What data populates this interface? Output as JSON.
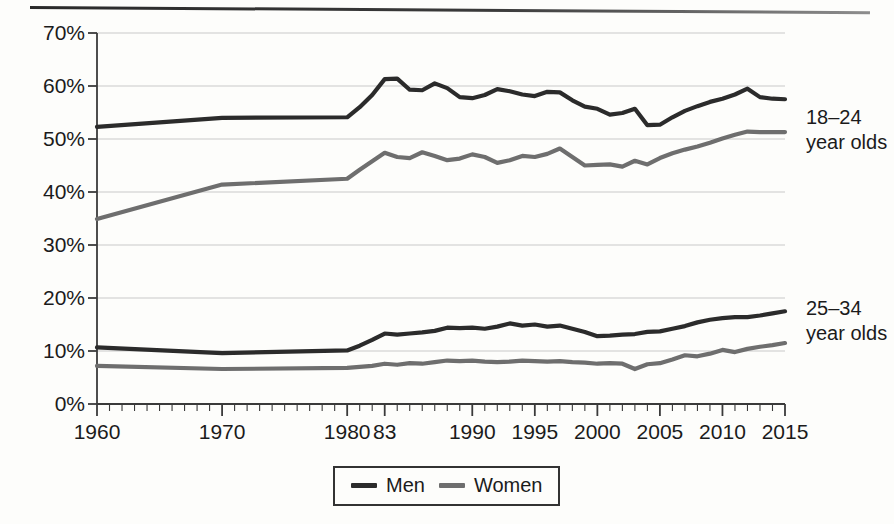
{
  "chart_data": {
    "type": "line",
    "title": "",
    "xlabel": "",
    "ylabel": "",
    "ylim": [
      0,
      70
    ],
    "xlim": [
      1960,
      2015
    ],
    "grid": true,
    "y_ticks": [
      "0%",
      "10%",
      "20%",
      "30%",
      "40%",
      "50%",
      "60%",
      "70%"
    ],
    "y_tick_values": [
      0,
      10,
      20,
      30,
      40,
      50,
      60,
      70
    ],
    "x_ticks": [
      "1960",
      "1970",
      "1980",
      "83",
      "1990",
      "1995",
      "2000",
      "2005",
      "2010",
      "2015"
    ],
    "x_tick_values": [
      1960,
      1970,
      1980,
      1983,
      1990,
      1995,
      2000,
      2005,
      2010,
      2015
    ],
    "minor_tick_interval": 1,
    "legend": {
      "position": "bottom-center",
      "entries": [
        "Men",
        "Women"
      ]
    },
    "annotations": [
      {
        "text_line1": "18–24",
        "text_line2": "year olds",
        "x": 2015,
        "y": 55
      },
      {
        "text_line1": "25–34",
        "text_line2": "year olds",
        "x": 2015,
        "y": 16
      }
    ],
    "colors": {
      "men": "#2b2b2b",
      "women": "#6e6e6e",
      "grid": "#c9c9c9",
      "axis": "#3a3a3a"
    },
    "series": [
      {
        "name": "Men 18–24",
        "group": "18-24 year olds",
        "sex": "Men",
        "color": "#2b2b2b",
        "x": [
          1960,
          1970,
          1980,
          1981,
          1982,
          1983,
          1984,
          1985,
          1986,
          1987,
          1988,
          1989,
          1990,
          1991,
          1992,
          1993,
          1994,
          1995,
          1996,
          1997,
          1998,
          1999,
          2000,
          2001,
          2002,
          2003,
          2004,
          2005,
          2006,
          2007,
          2008,
          2009,
          2010,
          2011,
          2012,
          2013,
          2014,
          2015
        ],
        "values": [
          52.3,
          54.0,
          54.1,
          56.0,
          58.3,
          61.3,
          61.4,
          59.3,
          59.2,
          60.5,
          59.6,
          57.9,
          57.7,
          58.3,
          59.4,
          59.0,
          58.4,
          58.1,
          58.9,
          58.8,
          57.3,
          56.1,
          55.7,
          54.6,
          54.9,
          55.7,
          52.6,
          52.7,
          54.1,
          55.3,
          56.2,
          57.0,
          57.6,
          58.4,
          59.5,
          57.9,
          57.6,
          57.5
        ]
      },
      {
        "name": "Women 18–24",
        "group": "18-24 year olds",
        "sex": "Women",
        "color": "#6e6e6e",
        "x": [
          1960,
          1970,
          1980,
          1981,
          1982,
          1983,
          1984,
          1985,
          1986,
          1987,
          1988,
          1989,
          1990,
          1991,
          1992,
          1993,
          1994,
          1995,
          1996,
          1997,
          1998,
          1999,
          2000,
          2001,
          2002,
          2003,
          2004,
          2005,
          2006,
          2007,
          2008,
          2009,
          2010,
          2011,
          2012,
          2013,
          2014,
          2015
        ],
        "values": [
          34.9,
          41.4,
          42.5,
          44.2,
          45.8,
          47.4,
          46.6,
          46.4,
          47.5,
          46.8,
          46.0,
          46.3,
          47.1,
          46.6,
          45.5,
          46.0,
          46.8,
          46.6,
          47.2,
          48.2,
          46.6,
          45.0,
          45.1,
          45.2,
          44.8,
          45.9,
          45.2,
          46.4,
          47.3,
          48.0,
          48.6,
          49.3,
          50.1,
          50.8,
          51.4,
          51.3,
          51.3,
          51.3
        ]
      },
      {
        "name": "Men 25–34",
        "group": "25-34 year olds",
        "sex": "Men",
        "color": "#2b2b2b",
        "x": [
          1960,
          1970,
          1980,
          1981,
          1982,
          1983,
          1984,
          1985,
          1986,
          1987,
          1988,
          1989,
          1990,
          1991,
          1992,
          1993,
          1994,
          1995,
          1996,
          1997,
          1998,
          1999,
          2000,
          2001,
          2002,
          2003,
          2004,
          2005,
          2006,
          2007,
          2008,
          2009,
          2010,
          2011,
          2012,
          2013,
          2014,
          2015
        ],
        "values": [
          10.7,
          9.6,
          10.1,
          11.0,
          12.1,
          13.3,
          13.1,
          13.3,
          13.5,
          13.8,
          14.4,
          14.3,
          14.4,
          14.2,
          14.6,
          15.2,
          14.8,
          15.0,
          14.6,
          14.8,
          14.2,
          13.6,
          12.8,
          12.9,
          13.1,
          13.2,
          13.6,
          13.7,
          14.2,
          14.7,
          15.4,
          15.9,
          16.2,
          16.4,
          16.4,
          16.7,
          17.1,
          17.5
        ]
      },
      {
        "name": "Women 25–34",
        "group": "25-34 year olds",
        "sex": "Women",
        "color": "#6e6e6e",
        "x": [
          1960,
          1970,
          1980,
          1981,
          1982,
          1983,
          1984,
          1985,
          1986,
          1987,
          1988,
          1989,
          1990,
          1991,
          1992,
          1993,
          1994,
          1995,
          1996,
          1997,
          1998,
          1999,
          2000,
          2001,
          2002,
          2003,
          2004,
          2005,
          2006,
          2007,
          2008,
          2009,
          2010,
          2011,
          2012,
          2013,
          2014,
          2015
        ],
        "values": [
          7.2,
          6.6,
          6.8,
          7.0,
          7.2,
          7.6,
          7.4,
          7.7,
          7.6,
          7.9,
          8.2,
          8.1,
          8.2,
          8.0,
          7.9,
          8.0,
          8.2,
          8.1,
          8.0,
          8.1,
          7.9,
          7.8,
          7.6,
          7.7,
          7.6,
          6.6,
          7.5,
          7.7,
          8.4,
          9.2,
          9.0,
          9.5,
          10.2,
          9.8,
          10.4,
          10.8,
          11.1,
          11.5
        ]
      }
    ]
  },
  "legend": {
    "men_label": "Men",
    "women_label": "Women"
  },
  "annotations": {
    "upper_line1": "18–24",
    "upper_line2": "year olds",
    "lower_line1": "25–34",
    "lower_line2": "year olds"
  }
}
